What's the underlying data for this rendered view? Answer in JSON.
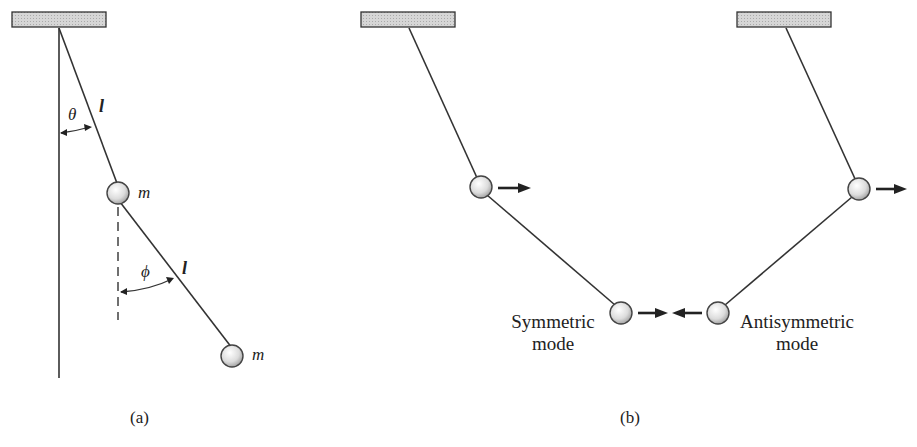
{
  "figure": {
    "panel_a": {
      "caption": "(a)",
      "upper_rod_label": "l",
      "lower_rod_label": "l",
      "theta_label": "θ",
      "phi_label": "ϕ",
      "upper_mass_label": "m",
      "lower_mass_label": "m"
    },
    "panel_b": {
      "caption": "(b)",
      "symmetric_label_line1": "Symmetric",
      "symmetric_label_line2": "mode",
      "antisymmetric_label_line1": "Antisymmetric",
      "antisymmetric_label_line2": "mode"
    }
  }
}
